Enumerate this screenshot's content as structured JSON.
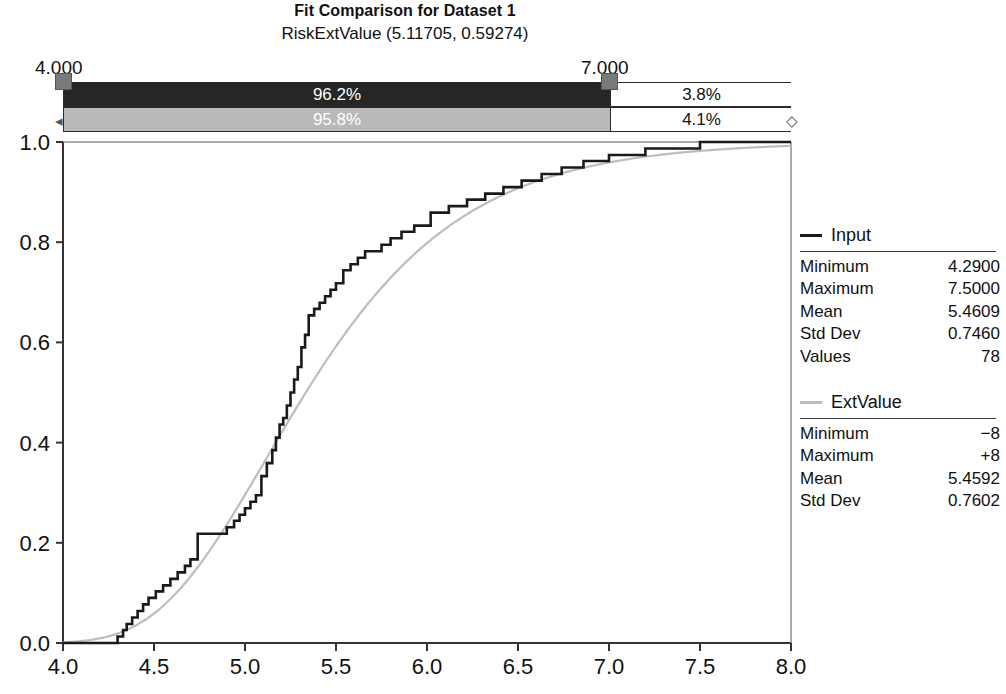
{
  "header": {
    "title": "Fit Comparison for Dataset 1",
    "subtitle": "RiskExtValue (5.11705, 0.59274)"
  },
  "delimiters": {
    "left_label": "4.000",
    "right_label": "7.000",
    "left_value": 4.0,
    "right_value": 7.0
  },
  "bands": [
    {
      "name": "input",
      "inside_label": "96.2%",
      "right_label": "3.8%",
      "inside_color": "#262626",
      "text_color": "#ffffff"
    },
    {
      "name": "extvalue",
      "inside_label": "95.8%",
      "right_label": "4.1%",
      "inside_color": "#b9b9b9",
      "text_color": "#ffffff"
    }
  ],
  "legend": [
    {
      "key": "input",
      "label": "Input",
      "color": "#1a1a1a"
    },
    {
      "key": "extvalue",
      "label": "ExtValue",
      "color": "#bdbdbd"
    }
  ],
  "stats": {
    "input": {
      "title": "Input",
      "rows": [
        {
          "key": "Minimum",
          "value": "4.2900"
        },
        {
          "key": "Maximum",
          "value": "7.5000"
        },
        {
          "key": "Mean",
          "value": "5.4609"
        },
        {
          "key": "Std Dev",
          "value": "0.7460"
        },
        {
          "key": "Values",
          "value": "78"
        }
      ]
    },
    "extvalue": {
      "title": "ExtValue",
      "rows": [
        {
          "key": "Minimum",
          "value": "−8"
        },
        {
          "key": "Maximum",
          "value": "+8"
        },
        {
          "key": "Mean",
          "value": "5.4592"
        },
        {
          "key": "Std Dev",
          "value": "0.7602"
        }
      ]
    }
  },
  "chart_data": {
    "type": "line",
    "title": "Fit Comparison for Dataset 1",
    "subtitle": "RiskExtValue (5.11705, 0.59274)",
    "xlabel": "",
    "ylabel": "",
    "xlim": [
      4.0,
      8.0
    ],
    "ylim": [
      0.0,
      1.0
    ],
    "xticks": [
      "4.0",
      "4.5",
      "5.0",
      "5.5",
      "6.0",
      "6.5",
      "7.0",
      "7.5",
      "8.0"
    ],
    "yticks": [
      "0.0",
      "0.2",
      "0.4",
      "0.6",
      "0.8",
      "1.0"
    ],
    "grid": false,
    "legend_position": "right",
    "distribution": {
      "name": "ExtValue",
      "location": 5.11705,
      "scale": 0.59274
    },
    "series": [
      {
        "name": "Input",
        "kind": "empirical-cdf-step",
        "color": "#1a1a1a",
        "x": [
          4.0,
          4.29,
          4.3,
          4.33,
          4.35,
          4.38,
          4.41,
          4.44,
          4.47,
          4.51,
          4.55,
          4.59,
          4.63,
          4.67,
          4.7,
          4.74,
          4.86,
          4.9,
          4.94,
          4.97,
          5.0,
          5.03,
          5.06,
          5.09,
          5.12,
          5.15,
          5.17,
          5.19,
          5.21,
          5.23,
          5.25,
          5.27,
          5.29,
          5.31,
          5.33,
          5.35,
          5.38,
          5.41,
          5.44,
          5.47,
          5.5,
          5.54,
          5.58,
          5.62,
          5.66,
          5.7,
          5.75,
          5.8,
          5.86,
          5.93,
          6.02,
          6.12,
          6.22,
          6.32,
          6.42,
          6.52,
          6.63,
          6.74,
          6.86,
          7.0,
          7.2,
          7.5,
          8.0
        ],
        "y": [
          0.0,
          0.0,
          0.013,
          0.026,
          0.038,
          0.051,
          0.064,
          0.077,
          0.09,
          0.103,
          0.115,
          0.128,
          0.141,
          0.154,
          0.167,
          0.218,
          0.218,
          0.231,
          0.244,
          0.256,
          0.269,
          0.282,
          0.295,
          0.333,
          0.359,
          0.385,
          0.41,
          0.436,
          0.449,
          0.474,
          0.5,
          0.526,
          0.551,
          0.59,
          0.615,
          0.654,
          0.667,
          0.679,
          0.692,
          0.705,
          0.718,
          0.744,
          0.756,
          0.769,
          0.782,
          0.782,
          0.795,
          0.808,
          0.821,
          0.833,
          0.859,
          0.872,
          0.885,
          0.897,
          0.91,
          0.923,
          0.936,
          0.949,
          0.962,
          0.974,
          0.987,
          1.0,
          1.0
        ]
      },
      {
        "name": "ExtValue",
        "kind": "fitted-cdf",
        "color": "#bdbdbd",
        "formula": "exp(-exp(-(x-5.11705)/0.59274))"
      }
    ]
  }
}
